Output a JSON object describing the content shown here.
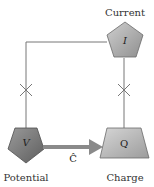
{
  "diagram": {
    "nodes": [
      {
        "id": "current",
        "label": "Current",
        "symbol": "I",
        "shape": "pentagon",
        "fill": "#a8a8a8"
      },
      {
        "id": "potential",
        "label": "Potential",
        "symbol": "V",
        "shape": "inverted-pentagon",
        "fill": "#7a7a7a"
      },
      {
        "id": "charge",
        "label": "Charge",
        "symbol": "Q",
        "shape": "trapezoid",
        "fill": "#b4b4b4"
      }
    ],
    "edges": [
      {
        "from": "current",
        "to": "potential",
        "style": "line",
        "marker": "cross"
      },
      {
        "from": "current",
        "to": "charge",
        "style": "line",
        "marker": "cross"
      },
      {
        "from": "potential",
        "to": "charge",
        "style": "thick-arrow",
        "label": "Ĉ"
      }
    ],
    "colors": {
      "line": "#777777",
      "arrow": "#8a8a8a",
      "text": "#333333"
    }
  }
}
